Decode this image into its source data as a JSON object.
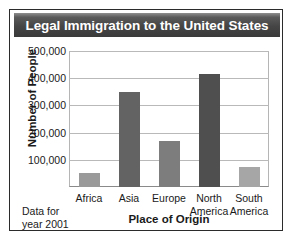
{
  "title": "Legal Immigration to the United States",
  "note": "Data for\nyear 2001",
  "chart_data": {
    "type": "bar",
    "title": "Legal Immigration to the United States",
    "xlabel": "Place of Origin",
    "ylabel": "Number of People",
    "categories": [
      "Africa",
      "Asia",
      "Europe",
      "North\nAmerica",
      "South\nAmerica"
    ],
    "values": [
      53000,
      350000,
      170000,
      415000,
      75000
    ],
    "ylim": [
      0,
      500000
    ],
    "yticks": [
      100000,
      200000,
      300000,
      400000,
      500000
    ],
    "ytick_labels": [
      "100,000",
      "200,000",
      "300,000",
      "400,000",
      "500,000"
    ],
    "grid": true,
    "legend": false,
    "bar_colors": [
      "#9a9a9a",
      "#636363",
      "#7d7d7d",
      "#4f4f4f",
      "#a6a6a6"
    ],
    "annotation": "Data for year 2001"
  },
  "colors": {
    "title_bar": "#454545",
    "title_text": "#ffffff",
    "panel_border": "#2b2b2b",
    "grid": "#b9b9b9",
    "axis": "#8a8a8a",
    "text": "#1a1a1a"
  }
}
